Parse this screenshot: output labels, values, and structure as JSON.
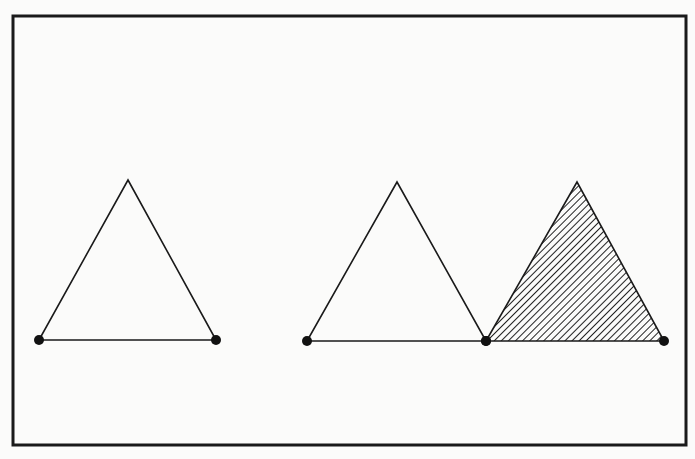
{
  "diagram": {
    "colors": {
      "background": "#fbfbfa",
      "stroke": "#1a1a1a",
      "hatch": "#222222",
      "vertex": "#111111"
    },
    "frame": {
      "x": 13,
      "y": 16,
      "width": 673,
      "height": 429,
      "stroke_width": 3
    },
    "triangles": [
      {
        "id": "triangle-left",
        "apex": [
          128,
          180
        ],
        "base_left": [
          39,
          340
        ],
        "base_right": [
          216,
          340
        ],
        "fill": "none",
        "vertex_dots": [
          "base_left",
          "base_right"
        ]
      },
      {
        "id": "triangle-middle",
        "apex": [
          397,
          182
        ],
        "base_left": [
          307,
          341
        ],
        "base_right": [
          486,
          341
        ],
        "fill": "none",
        "vertex_dots": [
          "base_left",
          "base_right"
        ]
      },
      {
        "id": "triangle-right-hatched",
        "apex": [
          577,
          182
        ],
        "base_left": [
          486,
          341
        ],
        "base_right": [
          664,
          341
        ],
        "fill": "hatched",
        "vertex_dots": [
          "base_left",
          "base_right"
        ]
      }
    ],
    "vertex_radius": 5
  }
}
